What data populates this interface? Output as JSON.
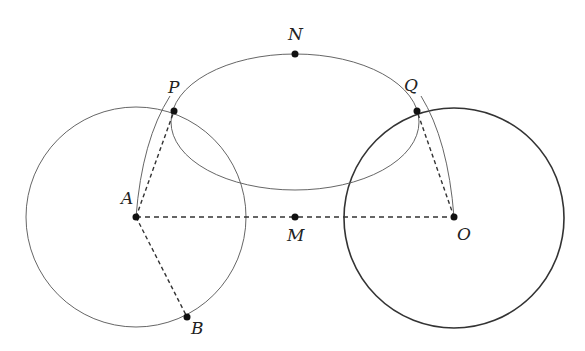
{
  "diagram": {
    "colors": {
      "stroke": "#555555",
      "stroke_bold": "#333333",
      "point": "#111111",
      "background": "#ffffff"
    },
    "points": {
      "A": {
        "label": "A",
        "x": 136,
        "y": 217
      },
      "O": {
        "label": "O",
        "x": 454,
        "y": 217
      },
      "M": {
        "label": "M",
        "x": 295,
        "y": 217
      },
      "N": {
        "label": "N",
        "x": 295,
        "y": 54
      },
      "P": {
        "label": "P",
        "x": 174,
        "y": 111
      },
      "Q": {
        "label": "Q",
        "x": 417,
        "y": 111
      },
      "B": {
        "label": "B",
        "x": 187,
        "y": 317
      }
    },
    "circles": [
      {
        "name": "circle-A",
        "center": "A",
        "r": 110
      },
      {
        "name": "circle-O",
        "center": "O",
        "r": 110
      },
      {
        "name": "circle-M",
        "center_x": 295,
        "center_y": 122,
        "rx": 124,
        "ry": 68
      }
    ],
    "dashed_segments": [
      [
        "A",
        "O"
      ],
      [
        "A",
        "P"
      ],
      [
        "A",
        "B"
      ],
      [
        "O",
        "Q"
      ]
    ],
    "arcs": [
      {
        "name": "arc-from-A-through-P"
      },
      {
        "name": "arc-from-O-through-Q"
      }
    ]
  }
}
